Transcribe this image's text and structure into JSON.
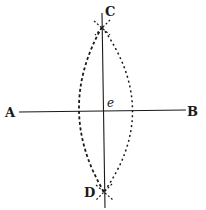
{
  "diagram": {
    "colors": {
      "ink": "#1a1a1a",
      "background": "#ffffff"
    },
    "labels": {
      "A": "A",
      "B": "B",
      "C": "C",
      "D": "D",
      "e": "e"
    },
    "points": {
      "A": [
        20,
        111
      ],
      "B": [
        186,
        110
      ],
      "C": [
        102,
        27
      ],
      "D": [
        104,
        192
      ],
      "e": [
        103,
        111
      ]
    },
    "elements": [
      {
        "type": "line",
        "from": "A",
        "to": "B",
        "style": "solid"
      },
      {
        "type": "line",
        "from": "C",
        "to": "D",
        "style": "solid",
        "extends_beyond": true
      },
      {
        "type": "arc",
        "through": [
          "C",
          "D"
        ],
        "side": "left",
        "style": "dashed"
      },
      {
        "type": "arc",
        "through": [
          "C",
          "D"
        ],
        "side": "right",
        "style": "dashed"
      }
    ]
  }
}
